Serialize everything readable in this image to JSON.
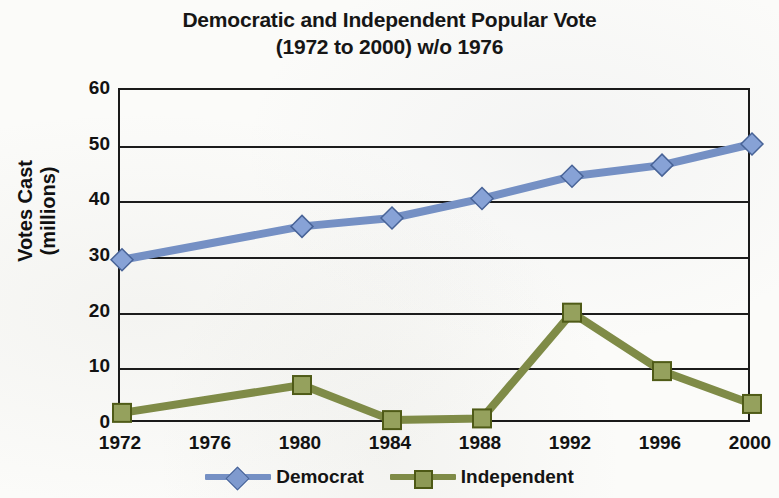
{
  "chart_data": {
    "type": "line",
    "title": "Democratic and Independent Popular Vote (1972 to 2000) w/o 1976",
    "title_lines": [
      "Democratic and Independent Popular Vote",
      "(1972 to 2000) w/o 1976"
    ],
    "xlabel": "",
    "ylabel": "Votes Cast (millions)",
    "ylabel_lines": [
      "Votes Cast",
      "(millions)"
    ],
    "categories": [
      "1972",
      "1976",
      "1980",
      "1984",
      "1988",
      "1992",
      "1996",
      "2000"
    ],
    "x_tick_labels": [
      "1972",
      "1976",
      "1980",
      "1984",
      "1988",
      "1992",
      "1996",
      "2000"
    ],
    "y_tick_labels": [
      "0",
      "10",
      "20",
      "30",
      "40",
      "50",
      "60"
    ],
    "y_ticks": [
      0,
      10,
      20,
      30,
      40,
      50,
      60
    ],
    "ylim": [
      0,
      60
    ],
    "grid": "horizontal",
    "legend_position": "bottom",
    "series": [
      {
        "name": "Democrat",
        "color": "#7590c4",
        "marker": "diamond",
        "values": [
          29.5,
          null,
          35.5,
          37.0,
          40.5,
          44.5,
          46.5,
          50.3
        ]
      },
      {
        "name": "Independent",
        "color": "#7f8b47",
        "marker": "square",
        "values": [
          2.0,
          null,
          7.0,
          0.7,
          1.0,
          20.0,
          9.5,
          3.6
        ]
      }
    ]
  },
  "legend": {
    "entries": [
      {
        "label": "Democrat"
      },
      {
        "label": "Independent"
      }
    ]
  }
}
